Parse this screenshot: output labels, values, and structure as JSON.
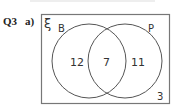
{
  "question": {
    "number": "Q3",
    "part": "a)"
  },
  "venn": {
    "universal_symbol": "ξ",
    "sets": [
      {
        "name": "B",
        "only_count": "12"
      },
      {
        "name": "P",
        "only_count": "11"
      }
    ],
    "intersection_count": "7",
    "outside_count": "3",
    "colors": {
      "outline": "#555555",
      "box": "#777777",
      "text": "#333333"
    }
  }
}
